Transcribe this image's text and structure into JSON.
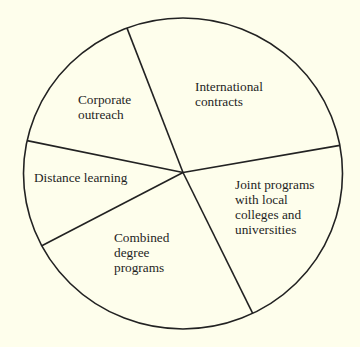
{
  "chart_data": {
    "type": "pie",
    "title": "",
    "legend": "none (labels inside slices)",
    "values_note": "No numeric labels shown; percentages estimated from slice angles",
    "slices": [
      {
        "label": "International contracts",
        "value": 27.8,
        "start_deg": 10.4,
        "end_deg": 110.6
      },
      {
        "label": "Corporate outreach",
        "value": 15.9,
        "start_deg": 110.6,
        "end_deg": 167.8
      },
      {
        "label": "Distance learning",
        "value": 11.1,
        "start_deg": 167.8,
        "end_deg": 207.7
      },
      {
        "label": "Combined degree programs",
        "value": 24.5,
        "start_deg": 207.7,
        "end_deg": 295.9
      },
      {
        "label": "Joint programs with local colleges and universities",
        "value": 20.7,
        "start_deg": 295.9,
        "end_deg": 370.4
      }
    ]
  },
  "geometry": {
    "cx": 183,
    "cy": 173.5,
    "rx": 159.5,
    "ry": 155.5,
    "boundary_degs": [
      10.4,
      110.6,
      167.8,
      207.7,
      295.9
    ]
  },
  "labels": {
    "international": {
      "text": "International\ncontracts",
      "x": 195,
      "y": 79
    },
    "corporate": {
      "text": "Corporate\noutreach",
      "x": 78,
      "y": 92
    },
    "distance": {
      "text": "Distance learning",
      "x": 34,
      "y": 170
    },
    "combined": {
      "text": "Combined\ndegree\nprograms",
      "x": 114,
      "y": 230
    },
    "joint": {
      "text": "Joint programs\nwith local\ncolleges and\nuniversities",
      "x": 235,
      "y": 177
    }
  },
  "colors": {
    "background": "#fefeec",
    "stroke": "#222222",
    "text": "#1e1e1e"
  }
}
